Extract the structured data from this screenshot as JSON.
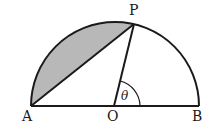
{
  "diagram": {
    "points": {
      "A": {
        "label": "A",
        "x": 31,
        "y": 106
      },
      "O": {
        "label": "O",
        "x": 114,
        "y": 106
      },
      "B": {
        "label": "B",
        "x": 199,
        "y": 106
      },
      "P": {
        "label": "P",
        "x": 134,
        "y": 24
      }
    },
    "angle": {
      "label": "θ",
      "vertex": "O",
      "between": [
        "OB",
        "OP"
      ]
    },
    "shaded_region": "segment between chord AP and arc AP",
    "colors": {
      "stroke": "#1a1a1a",
      "shade": "#b8b8b8",
      "background": "#ffffff"
    }
  }
}
